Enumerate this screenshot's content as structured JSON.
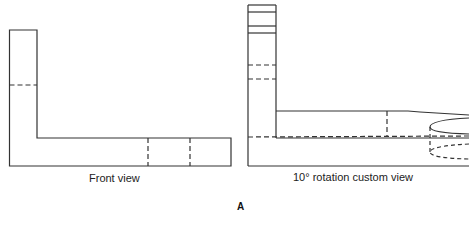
{
  "figure": {
    "label": "A",
    "views": [
      {
        "name": "front",
        "caption": "Front view"
      },
      {
        "name": "rotated",
        "caption": "10° rotation custom view"
      }
    ]
  },
  "colors": {
    "line": "#333333",
    "background": "#ffffff"
  }
}
